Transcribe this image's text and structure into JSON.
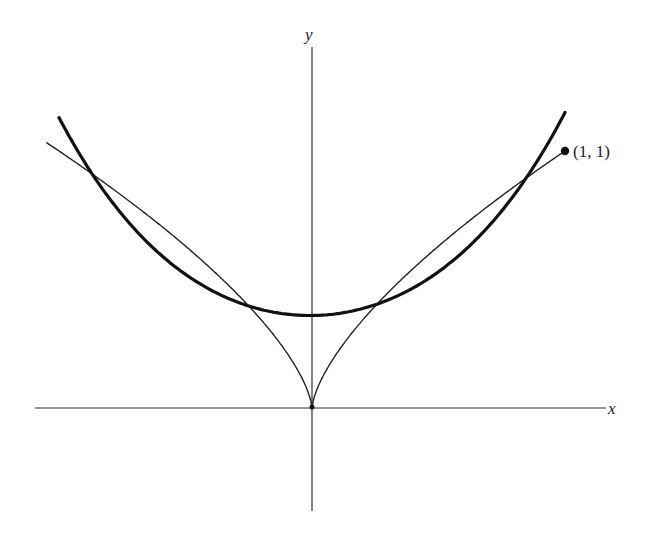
{
  "diagram": {
    "type": "function-plot",
    "axes": {
      "x_label": "x",
      "y_label": "y"
    },
    "point": {
      "label": "(1, 1)",
      "x": 1,
      "y": 1
    },
    "colors": {
      "curve": "#111111",
      "axis": "#333333",
      "background": "#ffffff"
    }
  },
  "chart_data": {
    "type": "line",
    "title": "",
    "xlabel": "x",
    "ylabel": "y",
    "xlim": [
      -1.1,
      1.17
    ],
    "ylim": [
      -0.4,
      1.4
    ],
    "grid": false,
    "series": [
      {
        "name": "thin curve y = |x|^(2/3)",
        "style": "thin",
        "x_range": [
          -1.05,
          1.0
        ],
        "formula": "abs(x)^(2/3)"
      },
      {
        "name": "thick curve (parabola-like)",
        "style": "thick",
        "x_range": [
          -1.0,
          1.0
        ],
        "values_at": {
          "x": [
            -1.0,
            -0.68,
            0,
            0.68,
            1.0
          ],
          "y": [
            1.13,
            0.69,
            0.36,
            0.69,
            1.15
          ]
        }
      }
    ],
    "annotations": [
      {
        "text": "(1, 1)",
        "x": 1,
        "y": 1,
        "marker": "dot"
      }
    ]
  }
}
